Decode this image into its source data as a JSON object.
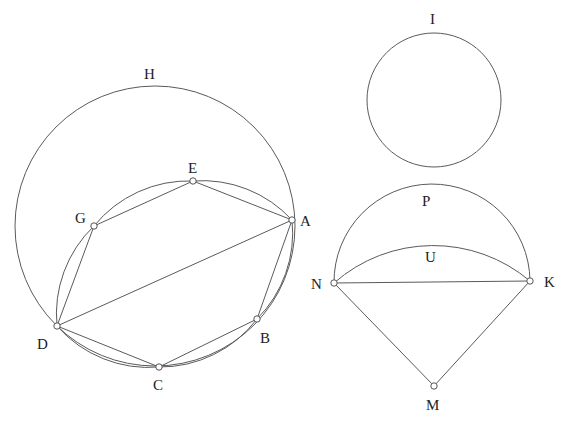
{
  "figure": {
    "width": 566,
    "height": 428,
    "stroke_color": "#5a5a5a",
    "label_color": "#222222",
    "background": "#ffffff"
  },
  "labels": {
    "H": "H",
    "E": "E",
    "G": "G",
    "A": "A",
    "D": "D",
    "C": "C",
    "B": "B",
    "I": "I",
    "P": "P",
    "U": "U",
    "N": "N",
    "K": "K",
    "M": "M"
  },
  "left_figure": {
    "outer_circle_label": "H",
    "hexagon_vertices": [
      "A",
      "E",
      "G",
      "D",
      "C",
      "B"
    ],
    "diagonal": [
      "A",
      "D"
    ]
  },
  "right_figure": {
    "circle_label": "I",
    "segment_arcs": [
      "P",
      "U"
    ],
    "chord": [
      "N",
      "K"
    ],
    "sector_apex": "M"
  }
}
